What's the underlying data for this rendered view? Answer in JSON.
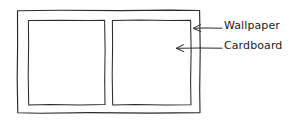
{
  "diagram": {
    "style": "hand-drawn line sketch",
    "background_color": "#ffffff",
    "line_color": "#2b2b2b",
    "text_color": "#1a1a1a",
    "shapes": {
      "outer_frame": {
        "name": "Wallpaper",
        "x": 17,
        "y": 10,
        "width": 183,
        "height": 103
      },
      "inner_panel_left": {
        "name": "Cardboard",
        "x": 28,
        "y": 20,
        "width": 77,
        "height": 85
      },
      "inner_panel_right": {
        "name": "Cardboard",
        "x": 112,
        "y": 20,
        "width": 79,
        "height": 85
      }
    },
    "annotations": [
      {
        "id": "wallpaper",
        "label": "Wallpaper",
        "arrow_from_x": 222,
        "arrow_to_x": 193,
        "arrow_y": 28,
        "points_to": "outer-frame"
      },
      {
        "id": "cardboard",
        "label": "Cardboard",
        "arrow_from_x": 222,
        "arrow_to_x": 176,
        "arrow_y": 48,
        "points_to": "inner-panel-right"
      }
    ]
  }
}
